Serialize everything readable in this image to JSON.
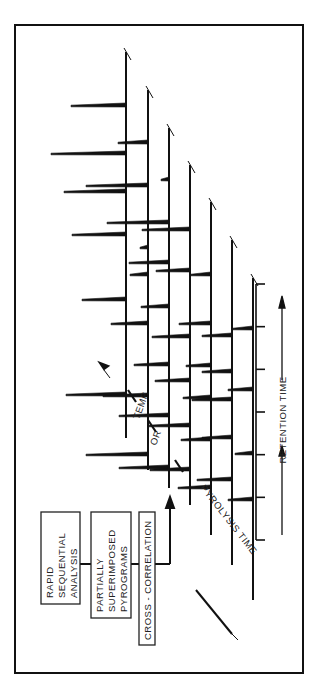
{
  "diagram": {
    "boxes": [
      {
        "id": "rapid",
        "lines": [
          "RAPID",
          "SEQUENTIAL",
          "ANALYSIS"
        ]
      },
      {
        "id": "partial",
        "lines": [
          "PARTIALLY",
          "SUPERIMPOSED",
          "PYROGRAMS"
        ]
      },
      {
        "id": "cross",
        "lines": [
          "CROSS - CORRELATION"
        ]
      }
    ],
    "labels": {
      "pyrolysis_time": "PYROLYSIS TIME",
      "or": "OR",
      "temp": "TEMP.",
      "retention_time": "RETENTION TIME"
    },
    "pyrogram_baselines": 7,
    "retention_axis_ticks": 7
  }
}
